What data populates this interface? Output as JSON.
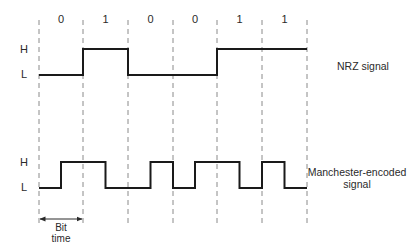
{
  "diagram": {
    "bits": [
      "0",
      "1",
      "0",
      "0",
      "1",
      "1"
    ],
    "boundaries_x": [
      39,
      83,
      128,
      173,
      217,
      262,
      307
    ],
    "dash_top_y": 20,
    "dash_bottom_y": 225,
    "colors": {
      "signal": "#1a1a1a",
      "dash": "#8a8a8a",
      "text": "#2a2a2a"
    }
  },
  "nrz": {
    "name": "NRZ signal",
    "high_label": "H",
    "low_label": "L",
    "high_y": 49,
    "low_y": 75,
    "levels": [
      "L",
      "H",
      "L",
      "L",
      "H",
      "H"
    ]
  },
  "manchester": {
    "name_line1": "Manchester-encoded",
    "name_line2": "signal",
    "high_label": "H",
    "low_label": "L",
    "high_y": 162,
    "low_y": 188,
    "encoding_note": "0 = low-to-high mid-bit, 1 = high-to-low mid-bit"
  },
  "bit_time": {
    "line1": "Bit",
    "line2": "time",
    "arrow_y": 219
  }
}
